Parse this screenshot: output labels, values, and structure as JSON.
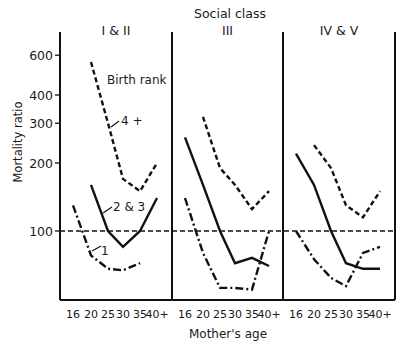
{
  "chart_data": {
    "type": "line",
    "title": "Social class",
    "xlabel": "Mother's age",
    "ylabel": "Mortality ratio",
    "yscale": "log",
    "ylim": [
      45,
      700
    ],
    "yticks": [
      100,
      200,
      300,
      400,
      600
    ],
    "reference_line": {
      "y": 100,
      "style": "dashed"
    },
    "categories": [
      "16",
      "20",
      "25",
      "30",
      "35",
      "40+"
    ],
    "legend_title": "Birth rank",
    "panels": [
      {
        "label": "I & II",
        "series": [
          {
            "name": "4 +",
            "style": "dashed",
            "values": [
              null,
              560,
              300,
              170,
              150,
              200
            ]
          },
          {
            "name": "2 & 3",
            "style": "solid",
            "values": [
              null,
              160,
              100,
              85,
              100,
              140
            ]
          },
          {
            "name": "1",
            "style": "dashdot",
            "values": [
              130,
              78,
              68,
              67,
              72,
              null
            ]
          }
        ]
      },
      {
        "label": "III",
        "series": [
          {
            "name": "4 +",
            "style": "dashed",
            "values": [
              null,
              320,
              190,
              160,
              125,
              150
            ]
          },
          {
            "name": "2 & 3",
            "style": "solid",
            "values": [
              260,
              160,
              100,
              72,
              76,
              70
            ]
          },
          {
            "name": "1",
            "style": "dashdot",
            "values": [
              140,
              80,
              56,
              56,
              55,
              100
            ]
          }
        ]
      },
      {
        "label": "IV & V",
        "series": [
          {
            "name": "4 +",
            "style": "dashed",
            "values": [
              null,
              240,
              190,
              130,
              115,
              150
            ]
          },
          {
            "name": "2 & 3",
            "style": "solid",
            "values": [
              220,
              160,
              100,
              72,
              68,
              68
            ]
          },
          {
            "name": "1",
            "style": "dashdot",
            "values": [
              100,
              75,
              62,
              57,
              80,
              85
            ]
          }
        ]
      }
    ],
    "annotations": [
      "Birth rank",
      "4 +",
      "2 & 3",
      "1"
    ],
    "grid": false
  },
  "labels": {
    "title": "Social class",
    "xlabel": "Mother's age",
    "ylabel": "Mortality ratio",
    "legend_title": "Birth rank",
    "series_4": "4 +",
    "series_23": "2 & 3",
    "series_1": "1"
  }
}
